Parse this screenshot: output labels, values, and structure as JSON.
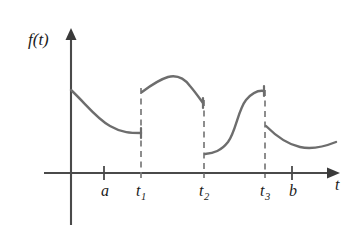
{
  "figure": {
    "title": "",
    "y_axis_label": "f(t)",
    "x_axis_label": "t",
    "curve_color": "#6d6d6d",
    "axis_color": "#4a4a4a",
    "dash_color": "#7a7a7a",
    "text_color": "#1b1b1b",
    "background": "#ffffff"
  },
  "x_ticks": [
    {
      "name": "a",
      "label": "a",
      "sub": "",
      "tick_x": 104,
      "label_x": 101,
      "label_y": 196
    },
    {
      "name": "t1",
      "label": "t",
      "sub": "1",
      "tick_x": 141,
      "label_x": 136,
      "label_y": 196
    },
    {
      "name": "t2",
      "label": "t",
      "sub": "2",
      "tick_x": 204,
      "label_x": 199,
      "label_y": 196
    },
    {
      "name": "t3",
      "label": "t",
      "sub": "3",
      "tick_x": 265,
      "label_x": 260,
      "label_y": 196
    },
    {
      "name": "b",
      "label": "b",
      "sub": "",
      "tick_x": 292,
      "label_x": 289,
      "label_y": 196
    }
  ],
  "discontinuities": [
    {
      "name": "t1",
      "x": 141,
      "top_y": 88,
      "bottom_y": 173
    },
    {
      "name": "t2",
      "x": 204,
      "top_y": 100,
      "bottom_y": 173
    },
    {
      "name": "t3",
      "x": 265,
      "top_y": 90,
      "bottom_y": 173
    }
  ],
  "chart_data": {
    "type": "line",
    "title": "",
    "xlabel": "t",
    "ylabel": "f(t)",
    "grid": false,
    "legend": false,
    "axis_origin": {
      "x": 71,
      "y": 173
    },
    "x_axis_range_px": [
      44,
      330
    ],
    "y_axis_range_px": [
      30,
      225
    ],
    "segments": [
      {
        "name": "segment-1",
        "interval": "[0, t1)",
        "shape": "decaying-convex",
        "start": {
          "x": 71,
          "y": 90
        },
        "end": {
          "x": 141,
          "y": 133
        },
        "path": "M 71 90 C 86 104, 96 118, 110 126 C 122 133, 131 133, 141 133"
      },
      {
        "name": "segment-2",
        "interval": "(t1, t2)",
        "shape": "rise-to-peak-then-fall",
        "start": {
          "x": 142,
          "y": 92
        },
        "peak": {
          "x": 176,
          "y": 76
        },
        "end": {
          "x": 203,
          "y": 103
        },
        "path": "M 142 92 C 150 86, 158 80, 168 77 C 176 75, 184 78, 190 86 C 196 93, 200 99, 203 103"
      },
      {
        "name": "segment-3",
        "interval": "(t2, t3)",
        "shape": "sigmoid-rise",
        "start": {
          "x": 205,
          "y": 154
        },
        "end": {
          "x": 264,
          "y": 91
        },
        "path": "M 205 154 C 214 153, 221 151, 228 142 C 236 131, 238 110, 246 100 C 252 93, 258 90, 264 91"
      },
      {
        "name": "segment-4",
        "interval": "(t3, b]",
        "shape": "decaying-convex-with-slight-rise",
        "start": {
          "x": 266,
          "y": 126
        },
        "end": {
          "x": 336,
          "y": 142
        },
        "path": "M 266 126 C 276 136, 286 144, 300 147 C 313 150, 326 146, 336 142"
      }
    ],
    "endpoint_bars": [
      {
        "name": "seg1-right-endpoint",
        "x": 141,
        "y": 133
      },
      {
        "name": "seg2-right-endpoint",
        "x": 203,
        "y": 103
      },
      {
        "name": "seg3-right-endpoint",
        "x": 264,
        "y": 91
      }
    ]
  },
  "labels": {
    "y_axis": {
      "text": "f(t)",
      "x": 28,
      "y": 45
    },
    "x_axis": {
      "text": "t",
      "x": 335,
      "y": 190
    }
  }
}
